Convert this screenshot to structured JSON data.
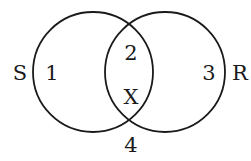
{
  "diagram": {
    "type": "venn",
    "sets": [
      {
        "name": "S",
        "label_x": 20,
        "label_y": 80,
        "cx": 93,
        "cy": 72,
        "r": 60
      },
      {
        "name": "R",
        "label_x": 240,
        "label_y": 80,
        "cx": 165,
        "cy": 72,
        "r": 60
      }
    ],
    "regions": [
      {
        "id": "region-1",
        "text": "1",
        "x": 52,
        "y": 80
      },
      {
        "id": "region-2",
        "text": "2",
        "x": 131,
        "y": 60
      },
      {
        "id": "region-3",
        "text": "3",
        "x": 209,
        "y": 80
      },
      {
        "id": "region-x",
        "text": "X",
        "x": 131,
        "y": 104
      },
      {
        "id": "region-4",
        "text": "4",
        "x": 131,
        "y": 152
      }
    ],
    "stroke_color": "#1a1a1a",
    "background": "#ffffff"
  }
}
